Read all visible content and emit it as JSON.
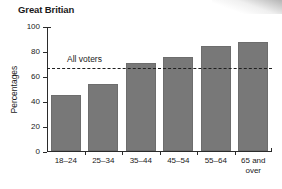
{
  "chart_data": {
    "type": "bar",
    "title": "Great Britian",
    "xlabel": "",
    "ylabel": "Percentages",
    "categories": [
      "18–24",
      "25–34",
      "35–44",
      "45–54",
      "55–64",
      "65 and over"
    ],
    "values": [
      45,
      54,
      71,
      76,
      85,
      88
    ],
    "ylim": [
      0,
      100
    ],
    "yticks": [
      0,
      20,
      40,
      60,
      80,
      100
    ],
    "ytick_labels": [
      "0",
      "20",
      "40",
      "60",
      "80",
      "100"
    ],
    "grid": false,
    "legend": "none",
    "bar_color": "#787878",
    "annotations": [
      {
        "label": "All voters",
        "type": "reference-line",
        "value": 67,
        "style": "dashed"
      }
    ]
  }
}
